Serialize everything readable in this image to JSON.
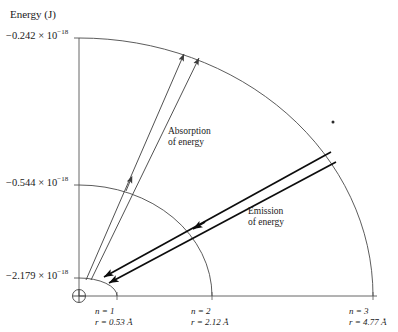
{
  "figure": {
    "kind": "bohr-model-energy-level-diagram",
    "axis_title": "Energy (J)",
    "energy_ticks": [
      {
        "id": "n3",
        "text": "−0.242 × 10",
        "exp": "−18",
        "value": -2.42e-19
      },
      {
        "id": "n2",
        "text": "−0.544 × 10",
        "exp": "−18",
        "value": -5.44e-19
      },
      {
        "id": "n1",
        "text": "−2.179 × 10",
        "exp": "−18",
        "value": -2.179e-18
      }
    ],
    "orbits": [
      {
        "n_label": "n = 1",
        "r_label": "r = 0.53 Å",
        "n": 1,
        "radius_angstrom": 0.53
      },
      {
        "n_label": "n = 2",
        "r_label": "r = 2.12 Å",
        "n": 2,
        "radius_angstrom": 2.12
      },
      {
        "n_label": "n = 3",
        "r_label": "r = 4.77 Å",
        "n": 3,
        "radius_angstrom": 4.77
      }
    ],
    "annotations": {
      "absorption": "Absorption\nof energy",
      "absorption_line1": "Absorption",
      "absorption_line2": "of energy",
      "emission": "Emission\nof energy",
      "emission_line1": "Emission",
      "emission_line2": "of energy"
    },
    "nucleus_symbol": "⊕",
    "colors": {
      "ink": "#1a1a1a",
      "arc": "#4a4a4a",
      "axis": "#555555",
      "absorption_arrow": "#3d3d3d",
      "emission_arrow": "#0d0d0d"
    }
  }
}
